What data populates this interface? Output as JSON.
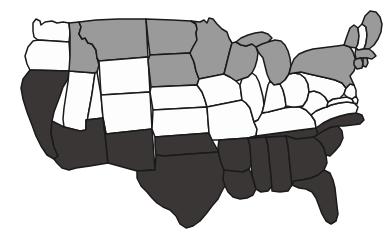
{
  "map": {
    "title": "United States Choropleth Map",
    "description": "Map of the contiguous United States with states shaded in three tones",
    "projection": "albers-usa",
    "viewbox": "0 0 387 244",
    "background_color": "#ffffff",
    "border_color": "#1a1a1a",
    "legend_categories": [
      {
        "key": "white",
        "label": "Category A",
        "color": "#fdfdfd"
      },
      {
        "key": "gray",
        "label": "Category B",
        "color": "#9a9a9a"
      },
      {
        "key": "dark",
        "label": "Category C",
        "color": "#3b3636"
      }
    ],
    "states": [
      {
        "code": "WA",
        "name": "Washington",
        "shade": "white",
        "color": "#fdfdfd"
      },
      {
        "code": "OR",
        "name": "Oregon",
        "shade": "white",
        "color": "#fdfdfd"
      },
      {
        "code": "CA",
        "name": "California",
        "shade": "dark",
        "color": "#3b3636"
      },
      {
        "code": "NV",
        "name": "Nevada",
        "shade": "white",
        "color": "#fdfdfd"
      },
      {
        "code": "ID",
        "name": "Idaho",
        "shade": "gray",
        "color": "#9a9a9a"
      },
      {
        "code": "MT",
        "name": "Montana",
        "shade": "gray",
        "color": "#9a9a9a"
      },
      {
        "code": "WY",
        "name": "Wyoming",
        "shade": "white",
        "color": "#fdfdfd"
      },
      {
        "code": "UT",
        "name": "Utah",
        "shade": "white",
        "color": "#fdfdfd"
      },
      {
        "code": "AZ",
        "name": "Arizona",
        "shade": "dark",
        "color": "#3b3636"
      },
      {
        "code": "CO",
        "name": "Colorado",
        "shade": "white",
        "color": "#fdfdfd"
      },
      {
        "code": "NM",
        "name": "New Mexico",
        "shade": "dark",
        "color": "#3b3636"
      },
      {
        "code": "ND",
        "name": "North Dakota",
        "shade": "gray",
        "color": "#9a9a9a"
      },
      {
        "code": "SD",
        "name": "South Dakota",
        "shade": "gray",
        "color": "#9a9a9a"
      },
      {
        "code": "NE",
        "name": "Nebraska",
        "shade": "white",
        "color": "#fdfdfd"
      },
      {
        "code": "KS",
        "name": "Kansas",
        "shade": "white",
        "color": "#fdfdfd"
      },
      {
        "code": "OK",
        "name": "Oklahoma",
        "shade": "dark",
        "color": "#3b3636"
      },
      {
        "code": "TX",
        "name": "Texas",
        "shade": "dark",
        "color": "#3b3636"
      },
      {
        "code": "MN",
        "name": "Minnesota",
        "shade": "gray",
        "color": "#9a9a9a"
      },
      {
        "code": "IA",
        "name": "Iowa",
        "shade": "white",
        "color": "#fdfdfd"
      },
      {
        "code": "MO",
        "name": "Missouri",
        "shade": "white",
        "color": "#fdfdfd"
      },
      {
        "code": "AR",
        "name": "Arkansas",
        "shade": "dark",
        "color": "#3b3636"
      },
      {
        "code": "LA",
        "name": "Louisiana",
        "shade": "dark",
        "color": "#3b3636"
      },
      {
        "code": "WI",
        "name": "Wisconsin",
        "shade": "gray",
        "color": "#9a9a9a"
      },
      {
        "code": "IL",
        "name": "Illinois",
        "shade": "white",
        "color": "#fdfdfd"
      },
      {
        "code": "MS",
        "name": "Mississippi",
        "shade": "dark",
        "color": "#3b3636"
      },
      {
        "code": "AL",
        "name": "Alabama",
        "shade": "dark",
        "color": "#3b3636"
      },
      {
        "code": "TN",
        "name": "Tennessee",
        "shade": "dark",
        "color": "#3b3636"
      },
      {
        "code": "KY",
        "name": "Kentucky",
        "shade": "white",
        "color": "#fdfdfd"
      },
      {
        "code": "IN",
        "name": "Indiana",
        "shade": "white",
        "color": "#fdfdfd"
      },
      {
        "code": "MI",
        "name": "Michigan",
        "shade": "gray",
        "color": "#9a9a9a"
      },
      {
        "code": "OH",
        "name": "Ohio",
        "shade": "white",
        "color": "#fdfdfd"
      },
      {
        "code": "GA",
        "name": "Georgia",
        "shade": "dark",
        "color": "#3b3636"
      },
      {
        "code": "FL",
        "name": "Florida",
        "shade": "dark",
        "color": "#3b3636"
      },
      {
        "code": "SC",
        "name": "South Carolina",
        "shade": "dark",
        "color": "#3b3636"
      },
      {
        "code": "NC",
        "name": "North Carolina",
        "shade": "dark",
        "color": "#3b3636"
      },
      {
        "code": "VA",
        "name": "Virginia",
        "shade": "white",
        "color": "#fdfdfd"
      },
      {
        "code": "WV",
        "name": "West Virginia",
        "shade": "white",
        "color": "#fdfdfd"
      },
      {
        "code": "MD",
        "name": "Maryland",
        "shade": "white",
        "color": "#fdfdfd"
      },
      {
        "code": "DE",
        "name": "Delaware",
        "shade": "white",
        "color": "#fdfdfd"
      },
      {
        "code": "PA",
        "name": "Pennsylvania",
        "shade": "white",
        "color": "#fdfdfd"
      },
      {
        "code": "NJ",
        "name": "New Jersey",
        "shade": "white",
        "color": "#fdfdfd"
      },
      {
        "code": "NY",
        "name": "New York",
        "shade": "gray",
        "color": "#9a9a9a"
      },
      {
        "code": "CT",
        "name": "Connecticut",
        "shade": "gray",
        "color": "#9a9a9a"
      },
      {
        "code": "RI",
        "name": "Rhode Island",
        "shade": "gray",
        "color": "#9a9a9a"
      },
      {
        "code": "MA",
        "name": "Massachusetts",
        "shade": "gray",
        "color": "#9a9a9a"
      },
      {
        "code": "VT",
        "name": "Vermont",
        "shade": "gray",
        "color": "#9a9a9a"
      },
      {
        "code": "NH",
        "name": "New Hampshire",
        "shade": "white",
        "color": "#fdfdfd"
      },
      {
        "code": "ME",
        "name": "Maine",
        "shade": "gray",
        "color": "#9a9a9a"
      }
    ]
  }
}
